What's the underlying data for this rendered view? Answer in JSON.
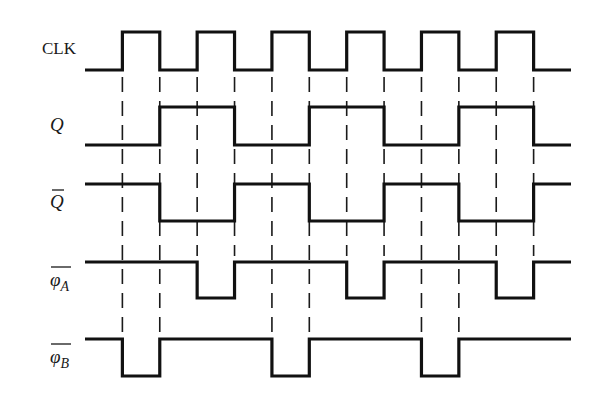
{
  "diagram": {
    "type": "timing-diagram",
    "time_units": 13,
    "signals": [
      {
        "id": "clk",
        "label": "CLK",
        "italic": false,
        "overline": false,
        "subscript": "",
        "levels": [
          0,
          1,
          0,
          1,
          0,
          1,
          0,
          1,
          0,
          1,
          0,
          1,
          0
        ]
      },
      {
        "id": "q",
        "label": "Q",
        "italic": true,
        "overline": false,
        "subscript": "",
        "levels": [
          0,
          0,
          1,
          1,
          0,
          0,
          1,
          1,
          0,
          0,
          1,
          1,
          0
        ]
      },
      {
        "id": "q-bar",
        "label": "Q",
        "italic": true,
        "overline": true,
        "subscript": "",
        "levels": [
          1,
          1,
          0,
          0,
          1,
          1,
          0,
          0,
          1,
          1,
          0,
          0,
          1
        ]
      },
      {
        "id": "phi-a-bar",
        "label": "φ",
        "italic": true,
        "overline": true,
        "subscript": "A",
        "levels": [
          1,
          1,
          1,
          0,
          1,
          1,
          1,
          0,
          1,
          1,
          1,
          0,
          1
        ]
      },
      {
        "id": "phi-b-bar",
        "label": "φ",
        "italic": true,
        "overline": true,
        "subscript": "B",
        "levels": [
          1,
          0,
          1,
          1,
          1,
          0,
          1,
          1,
          1,
          0,
          1,
          1,
          1
        ]
      }
    ],
    "reference_lines": [
      {
        "edge": 1,
        "to_signal": "phi-b-bar"
      },
      {
        "edge": 2,
        "to_signal": "phi-b-bar"
      },
      {
        "edge": 3,
        "to_signal": "phi-a-bar"
      },
      {
        "edge": 4,
        "to_signal": "phi-a-bar"
      },
      {
        "edge": 5,
        "to_signal": "phi-b-bar"
      },
      {
        "edge": 6,
        "to_signal": "phi-b-bar"
      },
      {
        "edge": 7,
        "to_signal": "phi-a-bar"
      },
      {
        "edge": 8,
        "to_signal": "phi-a-bar"
      },
      {
        "edge": 9,
        "to_signal": "phi-b-bar"
      },
      {
        "edge": 10,
        "to_signal": "phi-b-bar"
      },
      {
        "edge": 11,
        "to_signal": "phi-a-bar"
      },
      {
        "edge": 12,
        "to_signal": "phi-a-bar"
      }
    ]
  }
}
